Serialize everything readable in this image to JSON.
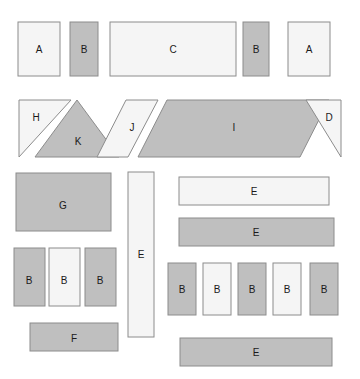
{
  "canvas": {
    "width": 360,
    "height": 379,
    "background": "#ffffff"
  },
  "palette": {
    "gray_fill": "#bfbfbf",
    "light_fill": "#f5f5f5",
    "stroke": "#8c8c8c",
    "label_color": "#1a1a1a"
  },
  "shapes": [
    {
      "id": "top-a-left",
      "label": "A",
      "kind": "rect",
      "fill": "light",
      "x": 18,
      "y": 22,
      "w": 42,
      "h": 54,
      "lx": 39,
      "ly": 50
    },
    {
      "id": "top-b-left",
      "label": "B",
      "kind": "rect",
      "fill": "gray",
      "x": 70,
      "y": 22,
      "w": 28,
      "h": 54,
      "lx": 84,
      "ly": 50
    },
    {
      "id": "top-c",
      "label": "C",
      "kind": "rect",
      "fill": "light",
      "x": 110,
      "y": 22,
      "w": 126,
      "h": 54,
      "lx": 173,
      "ly": 50
    },
    {
      "id": "top-b-right",
      "label": "B",
      "kind": "rect",
      "fill": "gray",
      "x": 243,
      "y": 22,
      "w": 26,
      "h": 54,
      "lx": 256,
      "ly": 50
    },
    {
      "id": "top-a-right",
      "label": "A",
      "kind": "rect",
      "fill": "light",
      "x": 288,
      "y": 22,
      "w": 42,
      "h": 54,
      "lx": 309,
      "ly": 50
    },
    {
      "id": "mid-h",
      "label": "H",
      "kind": "poly",
      "fill": "light",
      "points": "19,100 71,100 19,157",
      "lx": 36,
      "ly": 118
    },
    {
      "id": "mid-k",
      "label": "K",
      "kind": "poly",
      "fill": "gray",
      "points": "77,100 119,157 35,157",
      "lx": 78,
      "ly": 142
    },
    {
      "id": "mid-j",
      "label": "J",
      "kind": "poly",
      "fill": "light",
      "points": "126,100 158,100 128,157 97,157",
      "lx": 132,
      "ly": 128
    },
    {
      "id": "mid-i",
      "label": "I",
      "kind": "poly",
      "fill": "gray",
      "points": "167,100 329,100 300,157 138,157",
      "lx": 234,
      "ly": 128
    },
    {
      "id": "mid-d",
      "label": "D",
      "kind": "poly",
      "fill": "light",
      "points": "306,100 341,100 341,157",
      "lx": 329,
      "ly": 118
    },
    {
      "id": "low-g",
      "label": "G",
      "kind": "rect",
      "fill": "gray",
      "x": 16,
      "y": 173,
      "w": 95,
      "h": 58,
      "lx": 63,
      "ly": 206
    },
    {
      "id": "low-b-1",
      "label": "B",
      "kind": "rect",
      "fill": "gray",
      "x": 14,
      "y": 248,
      "w": 31,
      "h": 58,
      "lx": 29,
      "ly": 281
    },
    {
      "id": "low-b-2",
      "label": "B",
      "kind": "rect",
      "fill": "light",
      "x": 49,
      "y": 248,
      "w": 31,
      "h": 58,
      "lx": 64,
      "ly": 281
    },
    {
      "id": "low-b-3",
      "label": "B",
      "kind": "rect",
      "fill": "gray",
      "x": 85,
      "y": 248,
      "w": 31,
      "h": 58,
      "lx": 100,
      "ly": 281
    },
    {
      "id": "low-f",
      "label": "F",
      "kind": "rect",
      "fill": "gray",
      "x": 30,
      "y": 323,
      "w": 88,
      "h": 28,
      "lx": 74,
      "ly": 339
    },
    {
      "id": "low-e-vert",
      "label": "E",
      "kind": "rect",
      "fill": "light",
      "x": 128,
      "y": 172,
      "w": 26,
      "h": 165,
      "lx": 141,
      "ly": 255
    },
    {
      "id": "low-e-top",
      "label": "E",
      "kind": "rect",
      "fill": "light",
      "x": 179,
      "y": 177,
      "w": 150,
      "h": 28,
      "lx": 254,
      "ly": 192
    },
    {
      "id": "low-e-mid",
      "label": "E",
      "kind": "rect",
      "fill": "gray",
      "x": 179,
      "y": 218,
      "w": 155,
      "h": 28,
      "lx": 256,
      "ly": 233
    },
    {
      "id": "low-b-4",
      "label": "B",
      "kind": "rect",
      "fill": "gray",
      "x": 168,
      "y": 263,
      "w": 28,
      "h": 52,
      "lx": 182,
      "ly": 290
    },
    {
      "id": "low-b-5",
      "label": "B",
      "kind": "rect",
      "fill": "light",
      "x": 203,
      "y": 263,
      "w": 28,
      "h": 52,
      "lx": 217,
      "ly": 290
    },
    {
      "id": "low-b-6",
      "label": "B",
      "kind": "rect",
      "fill": "gray",
      "x": 238,
      "y": 263,
      "w": 28,
      "h": 52,
      "lx": 252,
      "ly": 290
    },
    {
      "id": "low-b-7",
      "label": "B",
      "kind": "rect",
      "fill": "light",
      "x": 273,
      "y": 263,
      "w": 28,
      "h": 52,
      "lx": 287,
      "ly": 290
    },
    {
      "id": "low-b-8",
      "label": "B",
      "kind": "rect",
      "fill": "gray",
      "x": 310,
      "y": 263,
      "w": 28,
      "h": 52,
      "lx": 324,
      "ly": 290
    },
    {
      "id": "low-e-bottom",
      "label": "E",
      "kind": "rect",
      "fill": "gray",
      "x": 180,
      "y": 338,
      "w": 152,
      "h": 28,
      "lx": 256,
      "ly": 353
    }
  ]
}
